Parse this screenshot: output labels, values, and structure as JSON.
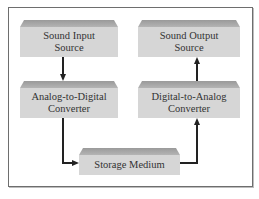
{
  "diagram": {
    "nodes": [
      {
        "id": "sound_input",
        "label_line1": "Sound Input",
        "label_line2": "Source"
      },
      {
        "id": "adc",
        "label_line1": "Analog-to-Digital",
        "label_line2": "Converter"
      },
      {
        "id": "storage",
        "label_line1": "Storage Medium",
        "label_line2": ""
      },
      {
        "id": "dac",
        "label_line1": "Digital-to-Analog",
        "label_line2": "Converter"
      },
      {
        "id": "sound_output",
        "label_line1": "Sound Output",
        "label_line2": "Source"
      }
    ],
    "edges": [
      {
        "from": "sound_input",
        "to": "adc"
      },
      {
        "from": "adc",
        "to": "storage"
      },
      {
        "from": "storage",
        "to": "dac"
      },
      {
        "from": "dac",
        "to": "sound_output"
      }
    ],
    "colors": {
      "box_face": "#d6d6d6",
      "box_bevel": "#a6a6a6",
      "arrow": "#222222",
      "frame": "#6e6e6e"
    }
  }
}
